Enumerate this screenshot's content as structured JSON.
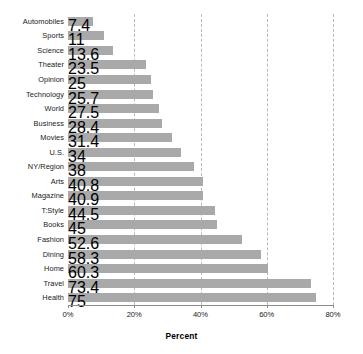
{
  "chart_data": {
    "type": "bar",
    "orientation": "horizontal",
    "title": "",
    "subtitle": "",
    "xlabel": "Percent",
    "ylabel": "",
    "xlim": [
      0,
      80
    ],
    "xticks": [
      0,
      20,
      40,
      60,
      80
    ],
    "xtick_labels": [
      "0%",
      "20%",
      "40%",
      "60%",
      "80%"
    ],
    "grid": "vertical-dashed",
    "legend": null,
    "bar_color": "#a9a9a9",
    "categories": [
      "Automobiles",
      "Sports",
      "Science",
      "Theater",
      "Opinion",
      "Technology",
      "World",
      "Business",
      "Movies",
      "U.S.",
      "NY/Region",
      "Arts",
      "Magazine",
      "T:Style",
      "Books",
      "Fashion",
      "Dining",
      "Home",
      "Travel",
      "Health"
    ],
    "values": [
      7.4,
      11,
      13.6,
      23.5,
      25,
      25.7,
      27.5,
      28.4,
      31.4,
      34,
      38,
      40.8,
      40.9,
      44.5,
      45,
      52.6,
      58.3,
      60.3,
      73.4,
      75
    ]
  }
}
